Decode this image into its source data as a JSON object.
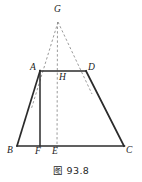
{
  "figure": {
    "caption": "图 93.8",
    "colors": {
      "solid_stroke": "#2b2b2b",
      "dashed_stroke": "#8e8e8e",
      "label_color": "#1a1a1a",
      "background": "#ffffff"
    },
    "points": {
      "G": {
        "label": "G",
        "x": 58,
        "y": 21,
        "label_x": 54,
        "label_y": 5
      },
      "A": {
        "label": "A",
        "x": 40,
        "y": 71,
        "label_x": 30,
        "label_y": 63
      },
      "D": {
        "label": "D",
        "x": 86,
        "y": 71,
        "label_x": 88,
        "label_y": 63
      },
      "H": {
        "label": "H",
        "x": 57,
        "y": 71,
        "label_x": 59,
        "label_y": 73
      },
      "B": {
        "label": "B",
        "x": 17,
        "y": 146,
        "label_x": 7,
        "label_y": 146
      },
      "F": {
        "label": "F",
        "x": 40,
        "y": 146,
        "label_x": 35,
        "label_y": 147
      },
      "E": {
        "label": "E",
        "x": 57,
        "y": 146,
        "label_x": 52,
        "label_y": 147
      },
      "C": {
        "label": "C",
        "x": 124,
        "y": 146,
        "label_x": 126,
        "label_y": 146
      }
    },
    "solid_segments": [
      {
        "name": "segment-AD",
        "from": "A",
        "to": "D",
        "x1": 40,
        "y1": 71,
        "x2": 86,
        "y2": 71
      },
      {
        "name": "segment-AB",
        "from": "A",
        "to": "B",
        "x1": 40,
        "y1": 71,
        "x2": 17,
        "y2": 146
      },
      {
        "name": "segment-DC",
        "from": "D",
        "to": "C",
        "x1": 86,
        "y1": 71,
        "x2": 124,
        "y2": 146
      },
      {
        "name": "segment-BC",
        "from": "B",
        "to": "C",
        "x1": 17,
        "y1": 146,
        "x2": 124,
        "y2": 146
      },
      {
        "name": "segment-AF",
        "from": "A",
        "to": "F",
        "x1": 40,
        "y1": 71,
        "x2": 40,
        "y2": 146
      }
    ],
    "dashed_segments": [
      {
        "name": "segment-GA",
        "from": "G",
        "to": "B",
        "x1": 58,
        "y1": 22,
        "x2": 31,
        "y2": 110
      },
      {
        "name": "segment-GD",
        "from": "G",
        "to": "C",
        "x1": 58,
        "y1": 22,
        "x2": 92,
        "y2": 94
      },
      {
        "name": "segment-GE",
        "from": "G",
        "to": "E",
        "x1": 58,
        "y1": 22,
        "x2": 57,
        "y2": 148
      }
    ]
  }
}
